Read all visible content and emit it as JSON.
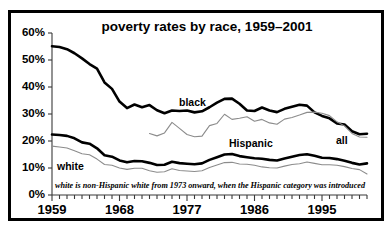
{
  "chart_data": {
    "type": "line",
    "title": "poverty rates by race, 1959–2001",
    "xlabel": "",
    "ylabel": "",
    "xlim": [
      1959,
      2001
    ],
    "ylim": [
      0,
      60
    ],
    "grid": false,
    "legend_position": "inline-annotations",
    "y_ticks": [
      0,
      10,
      20,
      30,
      40,
      50,
      60
    ],
    "y_tick_labels": [
      "0%",
      "10%",
      "20%",
      "30%",
      "40%",
      "50%",
      "60%"
    ],
    "x_ticks": [
      1959,
      1968,
      1977,
      1986,
      1995
    ],
    "x_tick_labels": [
      "1959",
      "1968",
      "1977",
      "1986",
      "1995"
    ],
    "x_minor_tick_interval": 1,
    "annotation": "white is non-Hispanic white from 1973 onward, when the Hispanic category was introduced",
    "series": [
      {
        "name": "black",
        "label": "black",
        "color": "#000000",
        "style": "thick",
        "x": [
          1959,
          1960,
          1961,
          1962,
          1963,
          1964,
          1965,
          1966,
          1967,
          1968,
          1969,
          1970,
          1971,
          1972,
          1973,
          1974,
          1975,
          1976,
          1977,
          1978,
          1979,
          1980,
          1981,
          1982,
          1983,
          1984,
          1985,
          1986,
          1987,
          1988,
          1989,
          1990,
          1991,
          1992,
          1993,
          1994,
          1995,
          1996,
          1997,
          1998,
          1999,
          2000,
          2001
        ],
        "values": [
          55.1,
          54.8,
          54.0,
          52.5,
          50.6,
          48.5,
          46.8,
          41.7,
          39.3,
          34.6,
          32.2,
          33.5,
          32.5,
          33.3,
          31.4,
          30.3,
          31.3,
          31.1,
          31.3,
          30.6,
          31.0,
          32.5,
          34.2,
          35.6,
          35.7,
          33.8,
          31.3,
          31.1,
          32.4,
          31.3,
          30.7,
          31.9,
          32.7,
          33.4,
          33.1,
          30.6,
          29.3,
          28.4,
          26.5,
          26.1,
          23.6,
          22.5,
          22.7
        ]
      },
      {
        "name": "hispanic",
        "label": "Hispanic",
        "color": "#8c8c8c",
        "style": "thin",
        "x": [
          1972,
          1973,
          1974,
          1975,
          1976,
          1977,
          1978,
          1979,
          1980,
          1981,
          1982,
          1983,
          1984,
          1985,
          1986,
          1987,
          1988,
          1989,
          1990,
          1991,
          1992,
          1993,
          1994,
          1995,
          1996,
          1997,
          1998,
          1999,
          2000,
          2001
        ],
        "values": [
          22.8,
          21.9,
          23.0,
          26.9,
          24.7,
          22.4,
          21.6,
          21.8,
          25.7,
          26.5,
          29.9,
          28.0,
          28.4,
          29.0,
          27.3,
          28.0,
          26.7,
          26.2,
          28.1,
          28.7,
          29.6,
          30.6,
          30.7,
          30.3,
          29.4,
          27.1,
          25.6,
          22.8,
          21.5,
          21.4
        ]
      },
      {
        "name": "all",
        "label": "all",
        "color": "#000000",
        "style": "thick",
        "x": [
          1959,
          1960,
          1961,
          1962,
          1963,
          1964,
          1965,
          1966,
          1967,
          1968,
          1969,
          1970,
          1971,
          1972,
          1973,
          1974,
          1975,
          1976,
          1977,
          1978,
          1979,
          1980,
          1981,
          1982,
          1983,
          1984,
          1985,
          1986,
          1987,
          1988,
          1989,
          1990,
          1991,
          1992,
          1993,
          1994,
          1995,
          1996,
          1997,
          1998,
          1999,
          2000,
          2001
        ],
        "values": [
          22.4,
          22.2,
          21.9,
          21.0,
          19.5,
          19.0,
          17.3,
          14.7,
          14.2,
          12.8,
          12.1,
          12.6,
          12.5,
          11.9,
          11.1,
          11.2,
          12.3,
          11.8,
          11.6,
          11.4,
          11.7,
          13.0,
          14.0,
          15.0,
          15.2,
          14.4,
          14.0,
          13.6,
          13.4,
          13.0,
          12.8,
          13.5,
          14.2,
          14.8,
          15.1,
          14.5,
          13.8,
          13.7,
          13.3,
          12.7,
          11.9,
          11.3,
          11.7
        ]
      },
      {
        "name": "white",
        "label": "white",
        "color": "#8c8c8c",
        "style": "thin",
        "x": [
          1959,
          1960,
          1961,
          1962,
          1963,
          1964,
          1965,
          1966,
          1967,
          1968,
          1969,
          1970,
          1971,
          1972,
          1973,
          1974,
          1975,
          1976,
          1977,
          1978,
          1979,
          1980,
          1981,
          1982,
          1983,
          1984,
          1985,
          1986,
          1987,
          1988,
          1989,
          1990,
          1991,
          1992,
          1993,
          1994,
          1995,
          1996,
          1997,
          1998,
          1999,
          2000,
          2001
        ],
        "values": [
          18.1,
          17.8,
          17.4,
          16.4,
          15.3,
          14.9,
          13.3,
          11.3,
          11.0,
          10.0,
          9.5,
          9.9,
          9.9,
          9.0,
          8.4,
          8.6,
          9.7,
          9.1,
          8.9,
          8.7,
          9.0,
          10.2,
          11.1,
          12.0,
          12.1,
          11.5,
          11.4,
          11.0,
          10.4,
          10.1,
          10.0,
          10.7,
          11.3,
          11.6,
          12.2,
          11.7,
          11.2,
          11.2,
          11.0,
          10.5,
          9.8,
          9.4,
          7.8
        ]
      }
    ]
  },
  "labels": {
    "black": "black",
    "hispanic": "Hispanic",
    "all": "all",
    "white": "white"
  }
}
